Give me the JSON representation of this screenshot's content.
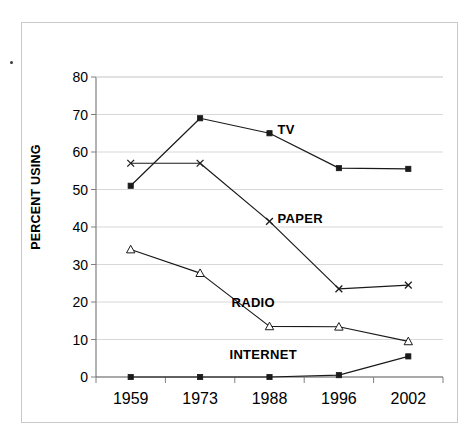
{
  "chart_data": {
    "type": "line",
    "title": "",
    "xlabel": "",
    "ylabel": "PERCENT USING",
    "categories": [
      "1959",
      "1973",
      "1988",
      "1996",
      "2002"
    ],
    "ylim": [
      0,
      80
    ],
    "yticks": [
      "0",
      "10",
      "20",
      "30",
      "40",
      "50",
      "60",
      "70",
      "80"
    ],
    "grid": true,
    "legend_position": "inline-labels",
    "series": [
      {
        "name": "TV",
        "marker": "filled-square",
        "color": "#1a1a1a",
        "values": [
          51,
          69,
          65,
          55.7,
          55.5
        ],
        "label": "TV"
      },
      {
        "name": "PAPER",
        "marker": "cross",
        "color": "#1a1a1a",
        "values": [
          57,
          57,
          41.5,
          23.5,
          24.5
        ],
        "label": "PAPER"
      },
      {
        "name": "RADIO",
        "marker": "open-triangle",
        "color": "#1a1a1a",
        "values": [
          34,
          27.7,
          13.5,
          13.4,
          9.5
        ],
        "label": "RADIO"
      },
      {
        "name": "INTERNET",
        "marker": "filled-square",
        "color": "#1a1a1a",
        "values": [
          0,
          0,
          0,
          0.5,
          5.5
        ],
        "label": "INTERNET"
      }
    ],
    "annotations": [
      {
        "text": "TV",
        "x_value": "1988",
        "y_value": 65,
        "dx": 8,
        "dy": -4
      },
      {
        "text": "PAPER",
        "x_value": "1988",
        "y_value": 41.5,
        "dx": 8,
        "dy": -3
      },
      {
        "text": "RADIO",
        "x_value": "1988",
        "y_value": 19.5,
        "dx": -38,
        "dy": -2
      },
      {
        "text": "INTERNET",
        "x_value": "1988",
        "y_value": 5.5,
        "dx": -40,
        "dy": -2
      }
    ]
  },
  "colors": {
    "line": "#1a1a1a",
    "grid": "#d8d8d8",
    "axis": "#808080",
    "frame": "#c9c9c9",
    "text": "#000000"
  }
}
